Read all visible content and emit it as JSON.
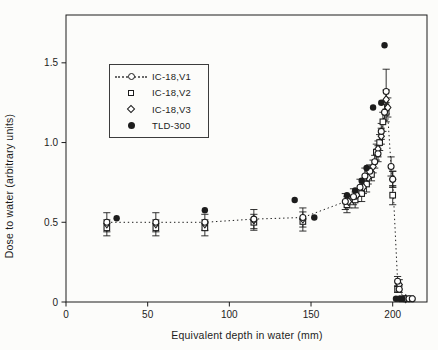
{
  "figure": {
    "background": "#fcfcfa",
    "ink_color": "#1c1c1c"
  },
  "chart_data": {
    "type": "scatter",
    "title": "",
    "xlabel": "Equivalent depth in water (mm)",
    "ylabel": "Dose to water (arbitrary units)",
    "xlim": [
      0,
      221
    ],
    "ylim": [
      0,
      1.8
    ],
    "x_ticks": [
      0,
      50,
      100,
      150,
      200
    ],
    "x_tick_labels": [
      "0",
      "50",
      "100",
      "150",
      "200"
    ],
    "y_ticks": [
      0,
      0.5,
      1.0,
      1.5
    ],
    "y_tick_labels": [
      "0",
      "0.5",
      "1.0",
      "1.5"
    ],
    "grid": false,
    "legend_position": "upper-left-inside",
    "series": [
      {
        "name": "IC-18,V1",
        "marker": "circle-open",
        "line": "dotted",
        "points": [
          [
            25,
            0.5,
            0.06
          ],
          [
            55,
            0.5,
            0.06
          ],
          [
            85,
            0.5,
            0.05
          ],
          [
            115,
            0.52,
            0.06
          ],
          [
            145,
            0.53,
            0.06
          ],
          [
            171,
            0.63,
            0.05
          ],
          [
            176,
            0.66,
            0.05
          ],
          [
            180,
            0.72,
            0.05
          ],
          [
            183,
            0.79,
            0.05
          ],
          [
            186,
            0.82,
            0.04
          ],
          [
            189,
            0.88,
            0.04
          ],
          [
            191,
            0.93,
            0.05
          ],
          [
            193,
            1.07,
            0.05
          ],
          [
            195,
            1.19,
            0.05
          ],
          [
            196,
            1.32,
            0.14
          ],
          [
            199,
            0.85,
            0.06
          ],
          [
            200,
            0.77,
            0.05
          ],
          [
            203,
            0.13,
            0.03
          ],
          [
            204,
            0.08,
            0.02
          ],
          [
            207,
            0.02,
            0
          ],
          [
            210,
            0.02,
            0
          ],
          [
            212,
            0.02,
            0
          ]
        ]
      },
      {
        "name": "IC-18,V2",
        "marker": "square-open",
        "line": "none",
        "points": [
          [
            25,
            0.465,
            0.05
          ],
          [
            55,
            0.465,
            0.05
          ],
          [
            85,
            0.465,
            0.05
          ],
          [
            115,
            0.5,
            0.05
          ],
          [
            145,
            0.505,
            0.06
          ],
          [
            172,
            0.61,
            0.05
          ],
          [
            177,
            0.64,
            0.05
          ],
          [
            181,
            0.68,
            0.05
          ],
          [
            184,
            0.74,
            0.05
          ],
          [
            187,
            0.8,
            0.04
          ],
          [
            190,
            0.94,
            0.05
          ],
          [
            192,
            1.0,
            0.05
          ],
          [
            194,
            1.13,
            0.06
          ],
          [
            196,
            1.19,
            0.06
          ],
          [
            200,
            0.67,
            0.06
          ],
          [
            203,
            0.08,
            0.02
          ],
          [
            206,
            0.02,
            0
          ],
          [
            211,
            0.02,
            0
          ]
        ]
      },
      {
        "name": "IC-18,V3",
        "marker": "diamond-open",
        "line": "none",
        "points": [
          [
            25,
            0.49,
            0
          ],
          [
            55,
            0.49,
            0
          ],
          [
            85,
            0.49,
            0
          ],
          [
            115,
            0.515,
            0
          ],
          [
            145,
            0.52,
            0
          ],
          [
            173,
            0.63,
            0.04
          ],
          [
            178,
            0.67,
            0.04
          ],
          [
            182,
            0.72,
            0.04
          ],
          [
            185,
            0.78,
            0.04
          ],
          [
            188,
            0.85,
            0.04
          ],
          [
            191,
            0.96,
            0.05
          ],
          [
            193,
            1.04,
            0.05
          ],
          [
            196,
            1.27,
            0.06
          ],
          [
            197,
            1.22,
            0.06
          ],
          [
            200,
            0.77,
            0.05
          ],
          [
            204,
            0.11,
            0.03
          ],
          [
            208,
            0.02,
            0
          ]
        ]
      },
      {
        "name": "TLD-300",
        "marker": "circle-filled",
        "line": "none",
        "points": [
          [
            31,
            0.525,
            0
          ],
          [
            85,
            0.575,
            0
          ],
          [
            140,
            0.64,
            0
          ],
          [
            152,
            0.53,
            0
          ],
          [
            172,
            0.67,
            0
          ],
          [
            177,
            0.7,
            0
          ],
          [
            181,
            0.76,
            0
          ],
          [
            184,
            0.84,
            0
          ],
          [
            188,
            1.22,
            0
          ],
          [
            193,
            1.25,
            0
          ],
          [
            195,
            1.61,
            0
          ],
          [
            202,
            0.02,
            0
          ],
          [
            204,
            0.02,
            0
          ],
          [
            206,
            0.02,
            0
          ]
        ]
      }
    ]
  }
}
